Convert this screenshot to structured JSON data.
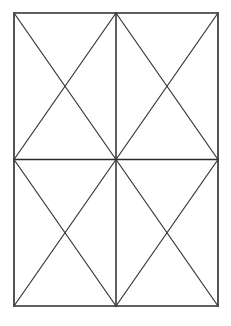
{
  "figure": {
    "background_color": "#ffffff",
    "line_color": "#2b2b2b",
    "diagonal_color": "#3a3a3a",
    "canvas": {
      "width": 231,
      "height": 326
    },
    "rect": {
      "left": 14,
      "top": 13,
      "right": 218,
      "bottom": 306,
      "width": 204,
      "height": 293
    },
    "center": {
      "x": 116,
      "y": 159.5
    },
    "frame": {
      "name": "outer-rectangle",
      "points": "14,13 218,13 218,306 14,306 14,13"
    },
    "dividers": [
      {
        "name": "vertical-midline",
        "x1": 116,
        "y1": 13,
        "x2": 116,
        "y2": 306
      },
      {
        "name": "horizontal-midline",
        "x1": 14,
        "y1": 159.5,
        "x2": 218,
        "y2": 159.5
      }
    ],
    "quadrants": [
      {
        "name": "top-left",
        "diagonals": [
          {
            "name": "tl-down-right",
            "x1": 14,
            "y1": 13,
            "x2": 116,
            "y2": 159.5
          },
          {
            "name": "tl-up-right",
            "x1": 14,
            "y1": 159.5,
            "x2": 116,
            "y2": 13
          }
        ]
      },
      {
        "name": "top-right",
        "diagonals": [
          {
            "name": "tr-down-right",
            "x1": 116,
            "y1": 13,
            "x2": 218,
            "y2": 159.5
          },
          {
            "name": "tr-up-right",
            "x1": 116,
            "y1": 159.5,
            "x2": 218,
            "y2": 13
          }
        ]
      },
      {
        "name": "bottom-left",
        "diagonals": [
          {
            "name": "bl-down-right",
            "x1": 14,
            "y1": 159.5,
            "x2": 116,
            "y2": 306
          },
          {
            "name": "bl-up-right",
            "x1": 14,
            "y1": 306,
            "x2": 116,
            "y2": 159.5
          }
        ]
      },
      {
        "name": "bottom-right",
        "diagonals": [
          {
            "name": "br-down-right",
            "x1": 116,
            "y1": 159.5,
            "x2": 218,
            "y2": 306
          },
          {
            "name": "br-up-right",
            "x1": 116,
            "y1": 306,
            "x2": 218,
            "y2": 159.5
          }
        ]
      }
    ]
  }
}
